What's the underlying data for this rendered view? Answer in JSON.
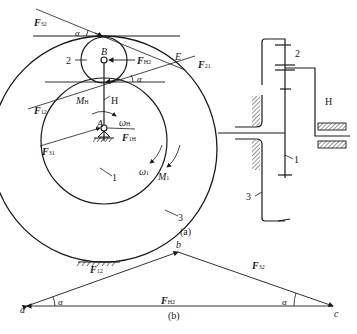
{
  "figure_a": {
    "caption": "(a)",
    "forces": {
      "F32": {
        "main": "F",
        "sub": "32"
      },
      "F12": {
        "main": "F",
        "sub": "12"
      },
      "FH2": {
        "main": "F",
        "sub": "H2"
      },
      "F21": {
        "main": "F",
        "sub": "21"
      },
      "F31": {
        "main": "F",
        "sub": "31"
      },
      "FH1": {
        "main": "F",
        "sub": "1H"
      }
    },
    "points": {
      "A": "A",
      "B": "B",
      "E": "E"
    },
    "angles": {
      "alpha_top": "α",
      "alpha_mid": "α"
    },
    "moments": {
      "MH": {
        "main": "M",
        "sub": "H"
      },
      "M1": {
        "main": "M",
        "sub": "1"
      }
    },
    "angular_velocities": {
      "wH": {
        "main": "ω",
        "sub": "H"
      },
      "w1": {
        "main": "ω",
        "sub": "1"
      }
    },
    "part_labels": {
      "gear2": "2",
      "carrier": "H",
      "gear1": "1",
      "ring3": "3"
    },
    "side_view_labels": {
      "gear2": "2",
      "carrier": "H",
      "gear1": "1",
      "ring3": "3"
    }
  },
  "figure_b": {
    "caption": "(b)",
    "vertices": {
      "a": "a",
      "b": "b",
      "c": "c"
    },
    "vectors": {
      "F12": {
        "main": "F",
        "sub": "12"
      },
      "F32": {
        "main": "F",
        "sub": "32"
      },
      "FH2": {
        "main": "F",
        "sub": "H2"
      }
    },
    "angles": {
      "alpha_left": "α",
      "alpha_right": "α"
    }
  }
}
